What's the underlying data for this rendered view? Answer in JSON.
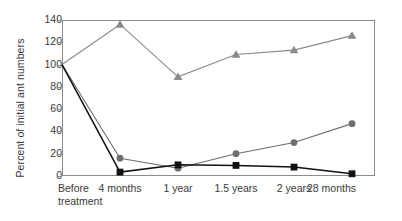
{
  "chart_data": {
    "type": "line",
    "title": "",
    "xlabel": "",
    "ylabel": "Percent of initial ant numbers",
    "categories": [
      "Before\ntreatment",
      "4 months",
      "1 year",
      "1.5 years",
      "2 years",
      "28 months"
    ],
    "ylim": [
      0,
      140
    ],
    "yticks": [
      0,
      20,
      40,
      60,
      80,
      100,
      120,
      140
    ],
    "grid": false,
    "legend": "none",
    "series": [
      {
        "name": "triangle-series",
        "marker": "triangle",
        "color": "#8a8a8a",
        "values": [
          100,
          136,
          89,
          109,
          113,
          126
        ]
      },
      {
        "name": "circle-series",
        "marker": "circle",
        "color": "#6e6e6e",
        "values": [
          100,
          16,
          7,
          20,
          30,
          47
        ]
      },
      {
        "name": "square-series",
        "marker": "square",
        "color": "#111111",
        "values": [
          100,
          3.5,
          10,
          9.5,
          8,
          2
        ]
      }
    ]
  },
  "axes": {
    "frame_color": "#8c8c8c",
    "tick_color": "#8c8c8c",
    "label_color": "#3a3a3a"
  }
}
